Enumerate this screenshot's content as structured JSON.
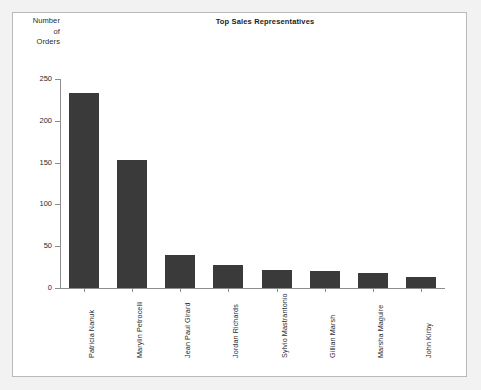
{
  "chart_data": {
    "type": "bar",
    "title": "Top Sales Representatives",
    "xlabel": "",
    "ylabel": "Number of Orders",
    "ylabel_lines": [
      "Number",
      "of",
      "Orders"
    ],
    "categories": [
      "Patricia Nanuk",
      "Marylin Petrocelli",
      "Jean Paul Girard",
      "Jordan Richards",
      "Sylvio Mastrantonio",
      "Gillian Marsh",
      "Marsha Maguire",
      "John Kirby"
    ],
    "values": [
      233,
      153,
      40,
      28,
      22,
      20,
      18,
      13
    ],
    "ylim": [
      0,
      250
    ],
    "yticks": [
      0,
      50,
      100,
      150,
      200,
      250
    ],
    "ytick_labels": [
      "0",
      "50",
      "100",
      "150",
      "200",
      "250"
    ],
    "grid": false,
    "legend": false,
    "bar_color": "#3a3a3a",
    "axis_color": "#8d8d8d",
    "plot_background": "#ffffff",
    "page_background": "#f2f2f2",
    "frame_color": "#b9b9b9"
  }
}
